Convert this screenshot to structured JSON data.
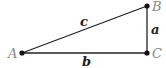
{
  "diagram": {
    "vertices": [
      {
        "id": "A",
        "label": "A",
        "x": 22,
        "y": 53,
        "lx": 8,
        "ly": 58
      },
      {
        "id": "B",
        "label": "B",
        "x": 147,
        "y": 6,
        "lx": 152,
        "ly": 11
      },
      {
        "id": "C",
        "label": "C",
        "x": 147,
        "y": 53,
        "lx": 152,
        "ly": 58
      }
    ],
    "sides": [
      {
        "id": "a",
        "label": "a",
        "from": "B",
        "to": "C",
        "lx": 151,
        "ly": 34
      },
      {
        "id": "b",
        "label": "b",
        "from": "A",
        "to": "C",
        "lx": 82,
        "ly": 66
      },
      {
        "id": "c",
        "label": "c",
        "from": "A",
        "to": "B",
        "lx": 80,
        "ly": 26
      }
    ],
    "colors": {
      "line": "#222222",
      "vertex_label": "#888888",
      "side_label": "#222222"
    }
  }
}
